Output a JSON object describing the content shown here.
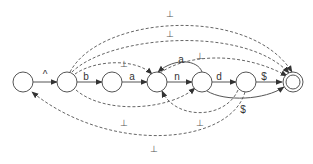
{
  "diagram": {
    "type": "finite-automaton",
    "states": [
      {
        "id": "s0",
        "accepting": false
      },
      {
        "id": "s1",
        "accepting": false
      },
      {
        "id": "s2",
        "accepting": false
      },
      {
        "id": "s3",
        "accepting": false
      },
      {
        "id": "s4",
        "accepting": false
      },
      {
        "id": "s5",
        "accepting": false
      },
      {
        "id": "s6",
        "accepting": true
      }
    ],
    "transitions": [
      {
        "from": "s0",
        "to": "s1",
        "label": "^",
        "style": "solid"
      },
      {
        "from": "s1",
        "to": "s2",
        "label": "b",
        "style": "solid"
      },
      {
        "from": "s2",
        "to": "s3",
        "label": "a",
        "style": "solid"
      },
      {
        "from": "s3",
        "to": "s4",
        "label": "n",
        "style": "solid"
      },
      {
        "from": "s4",
        "to": "s3",
        "label": "a",
        "style": "solid"
      },
      {
        "from": "s4",
        "to": "s5",
        "label": "d",
        "style": "solid"
      },
      {
        "from": "s5",
        "to": "s6",
        "label": "$",
        "style": "solid"
      },
      {
        "from": "s4",
        "to": "s6",
        "label": "$",
        "style": "solid"
      },
      {
        "from": "s1",
        "to": "s6",
        "label": "⊥",
        "style": "dashed"
      },
      {
        "from": "s1",
        "to": "s6",
        "label": "⊥",
        "style": "dashed"
      },
      {
        "from": "s1",
        "to": "s3",
        "label": "⊥",
        "style": "dashed"
      },
      {
        "from": "s3",
        "to": "s6",
        "label": "⊥",
        "style": "dashed"
      },
      {
        "from": "s1",
        "to": "s4",
        "label": "⊥",
        "style": "dashed"
      },
      {
        "from": "s4",
        "to": "s3",
        "label": "⊥",
        "style": "dashed"
      },
      {
        "from": "s5",
        "to": "s0",
        "label": "⊥",
        "style": "dashed"
      }
    ]
  }
}
